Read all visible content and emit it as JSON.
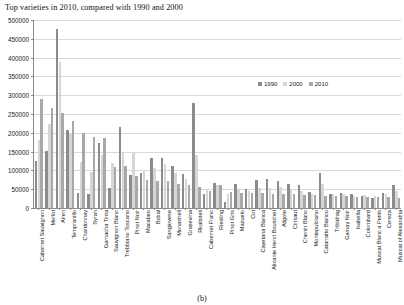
{
  "figure": {
    "caption": "(b)"
  },
  "legend": {
    "position": "top-right-inside",
    "entries": [
      {
        "label": "1990",
        "color": "#8c8c8c"
      },
      {
        "label": "2000",
        "color": "#d6d6d6"
      },
      {
        "label": "2010",
        "color": "#a8a8a8"
      }
    ]
  },
  "chart_data": {
    "type": "bar",
    "title": "Top varieties in 2010, compared with 1990 and 2000",
    "xlabel": "",
    "ylabel": "",
    "ylim": [
      0,
      500000
    ],
    "ytick_step": 50000,
    "yticks": [
      0,
      50000,
      100000,
      150000,
      200000,
      250000,
      300000,
      350000,
      400000,
      450000,
      500000
    ],
    "ytick_labels": [
      "0",
      "50000",
      "100000",
      "150000",
      "200000",
      "250000",
      "300000",
      "350000",
      "400000",
      "450000",
      "500000"
    ],
    "grid": true,
    "grid_axis": "y",
    "categories": [
      "Cabernet Sauvignon",
      "Merlot",
      "Airen",
      "Tempranillo",
      "Chardonnay",
      "Syrah",
      "Garnacha Tinta",
      "Sauvignon Blanc",
      "Trebbiano Toscano",
      "Pinot Noir",
      "Macabeo",
      "Bobal",
      "Sangiovese",
      "Monastrell",
      "Grasevina",
      "Rkatsiteli",
      "Cabernet Franc",
      "Riesling",
      "Pinot Gris",
      "Mazuelo",
      "Cot",
      "Cayetana Blanca",
      "Alicante Henri Bouschet",
      "Aligote",
      "Cinsaut",
      "Chenin Blanc",
      "Montepulciano",
      "Catarratto Bianco",
      "Tribidrag",
      "Gamay Noir",
      "Isabella",
      "Colombard",
      "Muscat Blanc a Petits",
      "Cereza",
      "Muscat of Alexandria"
    ],
    "series": [
      {
        "name": "1990",
        "color": "#8c8c8c",
        "values": [
          125000,
          152000,
          475000,
          207000,
          40000,
          36000,
          172000,
          52000,
          215000,
          89000,
          93000,
          133000,
          132000,
          112000,
          90000,
          278000,
          36000,
          66000,
          16000,
          63000,
          51000,
          75000,
          76000,
          72000,
          65000,
          62000,
          43000,
          92000,
          37000,
          40000,
          36000,
          32000,
          26000,
          41000,
          60000
        ]
      },
      {
        "name": "2000",
        "color": "#d6d6d6",
        "values": [
          180000,
          223000,
          388000,
          196000,
          122000,
          96000,
          142000,
          120000,
          146000,
          145000,
          101000,
          106000,
          116000,
          93000,
          76000,
          142000,
          48000,
          60000,
          38000,
          50000,
          46000,
          54000,
          52000,
          55000,
          50000,
          46000,
          38000,
          63000,
          38000,
          36000,
          32000,
          34000,
          32000,
          37000,
          45000
        ]
      },
      {
        "name": "2010",
        "color": "#a8a8a8",
        "values": [
          290000,
          267000,
          252000,
          232000,
          199000,
          190000,
          185000,
          110000,
          112000,
          86000,
          75000,
          73000,
          72000,
          63000,
          60000,
          57000,
          46000,
          60000,
          43000,
          40000,
          40000,
          40000,
          38000,
          37000,
          36000,
          34000,
          34000,
          33000,
          32000,
          31000,
          30000,
          30000,
          29000,
          28000,
          27000
        ]
      }
    ]
  }
}
